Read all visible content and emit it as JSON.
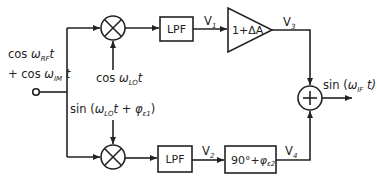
{
  "diagram": {
    "input": {
      "line1_prefix": "cos ",
      "line1_omega": "ω",
      "line1_sub": "RF",
      "line1_suffix": "t",
      "line2_prefix": "+ cos ",
      "line2_omega": "ω",
      "line2_sub": "IM",
      "line2_suffix": " t"
    },
    "top_path": {
      "lo_label_prefix": "cos ",
      "lo_label_omega": "ω",
      "lo_label_sub": "LO",
      "lo_label_suffix": "t",
      "lpf_label": "LPF",
      "v1_label": "V",
      "v1_sub": "1",
      "amp_label": "1+ΔA",
      "v3_label": "V",
      "v3_sub": "3"
    },
    "bottom_path": {
      "lo_label_prefix": "sin (",
      "lo_label_omega": "ω",
      "lo_label_sub": "LO",
      "lo_label_mid": "t + ",
      "lo_label_phi": "φ",
      "lo_label_phi_sub": "ε1",
      "lo_label_suffix": ")",
      "lpf_label": "LPF",
      "v2_label": "V",
      "v2_sub": "2",
      "shift_label_main": "90°+",
      "shift_label_phi": "φ",
      "shift_label_phi_sub": "ε2",
      "v4_label": "V",
      "v4_sub": "4"
    },
    "output": {
      "prefix": "sin (",
      "omega": "ω",
      "sub": "IF",
      "suffix": " t)"
    },
    "colors": {
      "line": "#222222",
      "background": "#ffffff"
    }
  }
}
